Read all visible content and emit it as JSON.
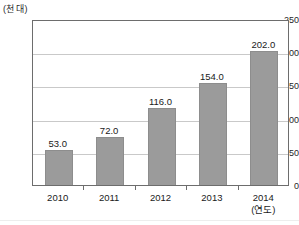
{
  "chart_data": {
    "type": "bar",
    "title": "",
    "subtitle": "",
    "xlabel": "(연도)",
    "ylabel": "(천 대)",
    "categories": [
      "2010",
      "2011",
      "2012",
      "2013",
      "2014"
    ],
    "values": [
      53.0,
      72.0,
      116.0,
      154.0,
      202.0
    ],
    "value_labels": [
      "53.0",
      "72.0",
      "116.0",
      "154.0",
      "202.0"
    ],
    "ylim": [
      0,
      250
    ],
    "yticks": [
      0,
      50,
      100,
      150,
      200,
      250
    ],
    "ytick_labels": [
      "0",
      "50",
      "100",
      "150",
      "200",
      "250"
    ],
    "grid": true,
    "grid_axis": "y",
    "legend": false,
    "legend_position": "none",
    "bar_color": "#9b9b9b",
    "axis_color": "#6d6d6d",
    "grid_color": "#c9c9c9",
    "text_color": "#1a1a1a"
  }
}
